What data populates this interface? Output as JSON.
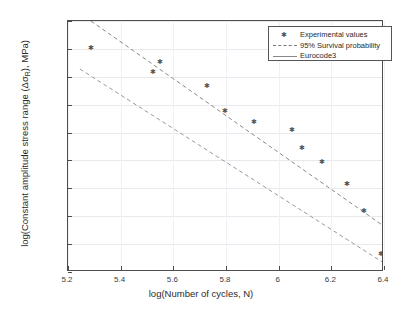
{
  "chart_data": {
    "type": "scatter",
    "title": "",
    "xlabel": "log(Number of cycles, N)",
    "ylabel_parts": {
      "prefix": "log(Constant amplitude stress range (Δσ",
      "sub": "R",
      "suffix": "), MPa)"
    },
    "ylabel": "log(Constant amplitude stress range (ΔσR), MPa)",
    "xlim": [
      5.2,
      6.4
    ],
    "ylim": [
      1.85,
      2.3
    ],
    "xticks": [
      "5.2",
      "5.4",
      "5.6",
      "5.8",
      "6",
      "6.2",
      "6.4"
    ],
    "xtick_values": [
      5.2,
      5.4,
      5.6,
      5.8,
      6.0,
      6.2,
      6.4
    ],
    "yticks": [
      "1.85",
      "1.9",
      "1.95",
      "2",
      "2.05",
      "2.1",
      "2.15",
      "2.2",
      "2.25",
      "2.3"
    ],
    "ytick_values": [
      1.85,
      1.9,
      1.95,
      2.0,
      2.05,
      2.1,
      2.15,
      2.2,
      2.25,
      2.3
    ],
    "grid": "horizontal",
    "legend_position": "top-right",
    "series": [
      {
        "name": "Experimental values",
        "type": "scatter",
        "marker": "asterisk",
        "color": "#555555",
        "points": [
          {
            "x": 5.285,
            "y": 2.252
          },
          {
            "x": 5.52,
            "y": 2.21
          },
          {
            "x": 5.548,
            "y": 2.228
          },
          {
            "x": 5.725,
            "y": 2.185
          },
          {
            "x": 5.795,
            "y": 2.139
          },
          {
            "x": 5.905,
            "y": 2.119
          },
          {
            "x": 6.048,
            "y": 2.105
          },
          {
            "x": 6.085,
            "y": 2.073
          },
          {
            "x": 6.163,
            "y": 2.048
          },
          {
            "x": 6.258,
            "y": 2.009
          },
          {
            "x": 6.323,
            "y": 1.961
          },
          {
            "x": 6.385,
            "y": 1.884
          }
        ]
      },
      {
        "name": "95% Survival probability",
        "type": "line",
        "style": "dashed",
        "color": "#888888",
        "endpoints": [
          {
            "x": 5.287,
            "y": 2.3
          },
          {
            "x": 6.4,
            "y": 1.932
          }
        ]
      },
      {
        "name": "Eurocode3",
        "type": "line",
        "style": "dashed",
        "color": "#999999",
        "endpoints": [
          {
            "x": 5.245,
            "y": 2.214
          },
          {
            "x": 6.4,
            "y": 1.866
          }
        ]
      }
    ]
  },
  "legend": {
    "items": [
      {
        "label": "Experimental values",
        "key": "marker"
      },
      {
        "label": "95% Survival probability",
        "key": "dashed-line"
      },
      {
        "label": "Eurocode3",
        "key": "solid-line"
      }
    ]
  },
  "marker_glyph": "✱"
}
